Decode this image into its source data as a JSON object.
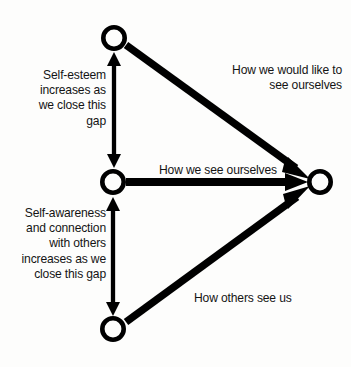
{
  "diagram": {
    "background_color": "#fdfdfc",
    "stroke_color": "#000000",
    "nodes": [
      {
        "id": "ideal-self-node",
        "name": "top-node",
        "cx": 114,
        "cy": 38,
        "r_outer": 13,
        "stroke_width": 4.6
      },
      {
        "id": "self-image-node",
        "name": "middle-node",
        "cx": 113,
        "cy": 182,
        "r_outer": 13,
        "stroke_width": 4.6
      },
      {
        "id": "others-view-node",
        "name": "bottom-node",
        "cx": 113,
        "cy": 329,
        "r_outer": 13,
        "stroke_width": 4.6
      },
      {
        "id": "person-node",
        "name": "right-node",
        "cx": 320,
        "cy": 182,
        "r_outer": 13,
        "stroke_width": 4.6
      }
    ],
    "edges": [
      {
        "id": "edge-ideal",
        "from": "ideal-self-node",
        "to": "person-node",
        "arrows": "end",
        "width": 7.5,
        "label": "ideal-self-label"
      },
      {
        "id": "edge-image",
        "from": "self-image-node",
        "to": "person-node",
        "arrows": "end",
        "width": 7.5,
        "label": "self-image-label"
      },
      {
        "id": "edge-others",
        "from": "others-view-node",
        "to": "person-node",
        "arrows": "end",
        "width": 7.5,
        "label": "others-view-label"
      },
      {
        "id": "gap-top",
        "from": "self-image-node",
        "to": "ideal-self-node",
        "arrows": "both",
        "width": 4.2,
        "label": "self-esteem-label"
      },
      {
        "id": "gap-bottom",
        "from": "self-image-node",
        "to": "others-view-node",
        "arrows": "both",
        "width": 4.2,
        "label": "self-awareness-label"
      }
    ]
  },
  "labels": {
    "self_esteem": "Self-esteem\nincreases as\nwe close this\ngap",
    "self_awareness": "Self-awareness\nand connection\nwith others\nincreases as we\nclose this gap",
    "ideal_self": "How we would like to\nsee ourselves",
    "self_image": "How we see ourselves",
    "others_view": "How others see us"
  }
}
